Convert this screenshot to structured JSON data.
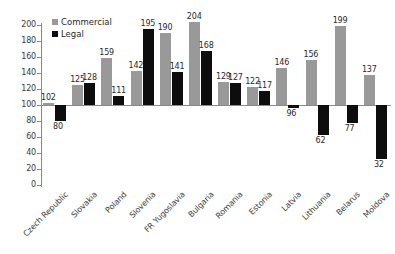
{
  "chart_data": {
    "type": "bar",
    "title": "",
    "xlabel": "",
    "ylabel": "",
    "ylim": [
      0,
      200
    ],
    "yticks": [
      0,
      20,
      40,
      60,
      80,
      100,
      120,
      140,
      160,
      180,
      200
    ],
    "grid": false,
    "legend_position": "top-left",
    "baseline": 100,
    "categories": [
      "Czech Republic",
      "Slovakia",
      "Poland",
      "Slovenia",
      "FR Yugoslavia",
      "Bulgaria",
      "Romania",
      "Estonia",
      "Latvia",
      "Lithuania",
      "Belarus",
      "Moldova"
    ],
    "series": [
      {
        "name": "Commercial",
        "color": "#999999",
        "values": [
          102,
          125,
          159,
          142,
          190,
          204,
          129,
          122,
          146,
          156,
          199,
          137
        ]
      },
      {
        "name": "Legal",
        "color": "#0d0d0d",
        "values": [
          80,
          128,
          111,
          195,
          141,
          168,
          127,
          117,
          96,
          62,
          77,
          32
        ]
      }
    ]
  }
}
